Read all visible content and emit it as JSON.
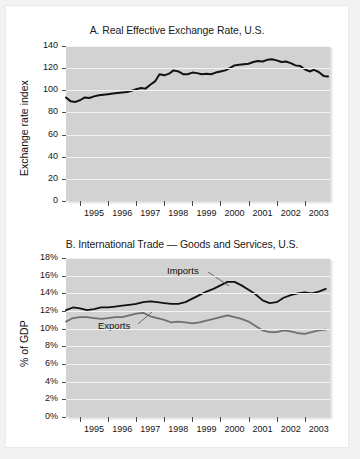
{
  "figure": {
    "background_color": "#f2f2f2",
    "sheet_color": "#ffffff",
    "plot_background_color": "#d2d2d2",
    "gridline_color": "#f3f3f3"
  },
  "chart_data": [
    {
      "id": "panel-a",
      "type": "line",
      "title": "A. Real Effective Exchange Rate, U.S.",
      "xlabel": "",
      "ylabel": "Exchange rate index",
      "ylim": [
        0,
        140
      ],
      "yticks": [
        0,
        20,
        40,
        60,
        80,
        100,
        120,
        140
      ],
      "ytick_labels": [
        "0",
        "20",
        "40",
        "60",
        "80",
        "100",
        "120",
        "140"
      ],
      "xlim": [
        1994.5,
        2003.9
      ],
      "xtick_labels": [
        "1995",
        "1996",
        "1997",
        "1998",
        "1999",
        "2000",
        "2001",
        "2002",
        "2003"
      ],
      "grid": true,
      "legend": "none",
      "line_color": "#111111",
      "series": [
        {
          "name": "Real effective exchange rate",
          "x": [
            1994.5,
            1994.67,
            1994.83,
            1995.0,
            1995.17,
            1995.33,
            1995.5,
            1995.67,
            1995.83,
            1996.0,
            1996.17,
            1996.33,
            1996.5,
            1996.67,
            1996.83,
            1997.0,
            1997.17,
            1997.33,
            1997.5,
            1997.67,
            1997.83,
            1998.0,
            1998.17,
            1998.33,
            1998.5,
            1998.67,
            1998.83,
            1999.0,
            1999.17,
            1999.33,
            1999.5,
            1999.67,
            1999.83,
            2000.0,
            2000.17,
            2000.33,
            2000.5,
            2000.67,
            2000.83,
            2001.0,
            2001.17,
            2001.33,
            2001.5,
            2001.67,
            2001.83,
            2002.0,
            2002.17,
            2002.33,
            2002.5,
            2002.67,
            2002.83,
            2003.0,
            2003.17,
            2003.33,
            2003.5,
            2003.67,
            2003.83
          ],
          "y": [
            93.5,
            90.0,
            89.5,
            91.0,
            93.5,
            93.0,
            94.5,
            95.5,
            96.0,
            96.5,
            97.0,
            97.5,
            98.0,
            98.5,
            99.5,
            101.0,
            102.0,
            101.5,
            105.0,
            108.0,
            114.5,
            113.5,
            115.0,
            118.0,
            117.0,
            114.5,
            114.5,
            116.0,
            115.5,
            114.5,
            115.0,
            114.5,
            116.0,
            117.0,
            118.0,
            120.0,
            122.5,
            123.0,
            123.5,
            124.0,
            125.5,
            126.5,
            126.0,
            127.5,
            128.0,
            127.0,
            125.5,
            126.0,
            124.5,
            122.5,
            122.0,
            119.0,
            117.0,
            118.5,
            116.5,
            113.0,
            112.5
          ]
        }
      ]
    },
    {
      "id": "panel-b",
      "type": "line",
      "title": "B. International Trade — Goods and Services, U.S.",
      "xlabel": "",
      "ylabel": "% of GDP",
      "ylim": [
        0,
        18
      ],
      "yticks": [
        0,
        2,
        4,
        6,
        8,
        10,
        12,
        14,
        16,
        18
      ],
      "ytick_labels": [
        "0%",
        "2%",
        "4%",
        "6%",
        "8%",
        "10%",
        "12%",
        "14%",
        "16%",
        "18%"
      ],
      "xlim": [
        1994.5,
        2003.9
      ],
      "xtick_labels": [
        "1995",
        "1996",
        "1997",
        "1998",
        "1999",
        "2000",
        "2001",
        "2002",
        "2003"
      ],
      "grid": true,
      "legend": "inline-annotations",
      "annotations": [
        {
          "text": "Imports",
          "series": "Imports"
        },
        {
          "text": "Exports",
          "series": "Exports"
        }
      ],
      "series": [
        {
          "name": "Imports",
          "color": "#111111",
          "x": [
            1994.5,
            1994.75,
            1995.0,
            1995.25,
            1995.5,
            1995.75,
            1996.0,
            1996.25,
            1996.5,
            1996.75,
            1997.0,
            1997.25,
            1997.5,
            1997.75,
            1998.0,
            1998.25,
            1998.5,
            1998.75,
            1999.0,
            1999.25,
            1999.5,
            1999.75,
            2000.0,
            2000.25,
            2000.5,
            2000.75,
            2001.0,
            2001.25,
            2001.5,
            2001.75,
            2002.0,
            2002.25,
            2002.5,
            2002.75,
            2003.0,
            2003.25,
            2003.5,
            2003.75
          ],
          "y": [
            12.1,
            12.4,
            12.3,
            12.1,
            12.2,
            12.4,
            12.4,
            12.5,
            12.6,
            12.7,
            12.8,
            13.0,
            13.1,
            13.0,
            12.9,
            12.8,
            12.8,
            13.0,
            13.4,
            13.8,
            14.2,
            14.5,
            14.9,
            15.3,
            15.3,
            14.9,
            14.4,
            13.9,
            13.2,
            12.9,
            13.0,
            13.5,
            13.8,
            14.0,
            14.1,
            14.0,
            14.2,
            14.5
          ]
        },
        {
          "name": "Exports",
          "color": "#6f6f6f",
          "x": [
            1994.5,
            1994.75,
            1995.0,
            1995.25,
            1995.5,
            1995.75,
            1996.0,
            1996.25,
            1996.5,
            1996.75,
            1997.0,
            1997.25,
            1997.5,
            1997.75,
            1998.0,
            1998.25,
            1998.5,
            1998.75,
            1999.0,
            1999.25,
            1999.5,
            1999.75,
            2000.0,
            2000.25,
            2000.5,
            2000.75,
            2001.0,
            2001.25,
            2001.5,
            2001.75,
            2002.0,
            2002.25,
            2002.5,
            2002.75,
            2003.0,
            2003.25,
            2003.5,
            2003.75
          ],
          "y": [
            10.8,
            11.2,
            11.3,
            11.3,
            11.2,
            11.1,
            11.2,
            11.3,
            11.3,
            11.5,
            11.7,
            11.8,
            11.4,
            11.2,
            11.0,
            10.7,
            10.8,
            10.7,
            10.6,
            10.7,
            10.9,
            11.1,
            11.3,
            11.5,
            11.3,
            11.1,
            10.8,
            10.3,
            9.8,
            9.6,
            9.6,
            9.8,
            9.7,
            9.5,
            9.4,
            9.6,
            9.8,
            9.9
          ]
        }
      ]
    }
  ]
}
